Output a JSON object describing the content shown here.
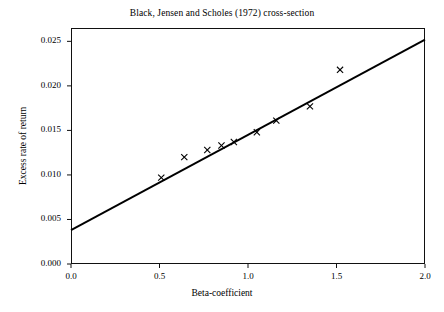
{
  "chart_data": {
    "type": "scatter",
    "title": "Black, Jensen and Scholes (1972) cross-section",
    "xlabel": "Beta-coefficient",
    "ylabel": "Excess rate of return",
    "xlim": [
      0.0,
      2.0
    ],
    "ylim": [
      0.0,
      0.0265
    ],
    "grid": false,
    "legend": "none",
    "marker": "x",
    "xticks": [
      0.0,
      0.5,
      1.0,
      1.5,
      2.0
    ],
    "xtick_labels": [
      "0.0",
      "0.5",
      "1.0",
      "1.5",
      "2.0"
    ],
    "yticks": [
      0.0,
      0.005,
      0.01,
      0.015,
      0.02,
      0.025
    ],
    "ytick_labels": [
      "0.000",
      "0.005",
      "0.010",
      "0.015",
      "0.020",
      "0.025"
    ],
    "x": [
      0.51,
      0.64,
      0.77,
      0.85,
      0.92,
      1.05,
      1.16,
      1.35,
      1.52
    ],
    "y": [
      0.0097,
      0.012,
      0.0128,
      0.0133,
      0.0137,
      0.0148,
      0.0161,
      0.0177,
      0.0218
    ],
    "fit_line": {
      "type": "line",
      "intercept": 0.0038,
      "slope": 0.0107,
      "x_endpoints": [
        0.0,
        2.0
      ],
      "y_endpoints": [
        0.0038,
        0.0252
      ]
    }
  }
}
